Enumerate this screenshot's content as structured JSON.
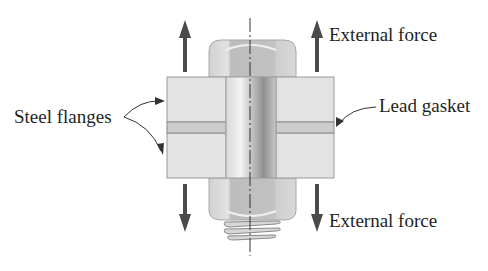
{
  "diagram": {
    "labels": {
      "external_force_top": "External force",
      "external_force_bottom": "External force",
      "steel_flanges": "Steel flanges",
      "lead_gasket": "Lead gasket"
    },
    "colors": {
      "flange_fill": "#e3e3e3",
      "flange_stroke": "#9a9a9a",
      "gasket_fill": "#cdcdcd",
      "bolt_light": "#efefef",
      "bolt_dark": "#9c9c9c",
      "head_fill": "#c4c4c4",
      "arrow": "#4a4a4a",
      "text": "#1f1f1f"
    }
  }
}
